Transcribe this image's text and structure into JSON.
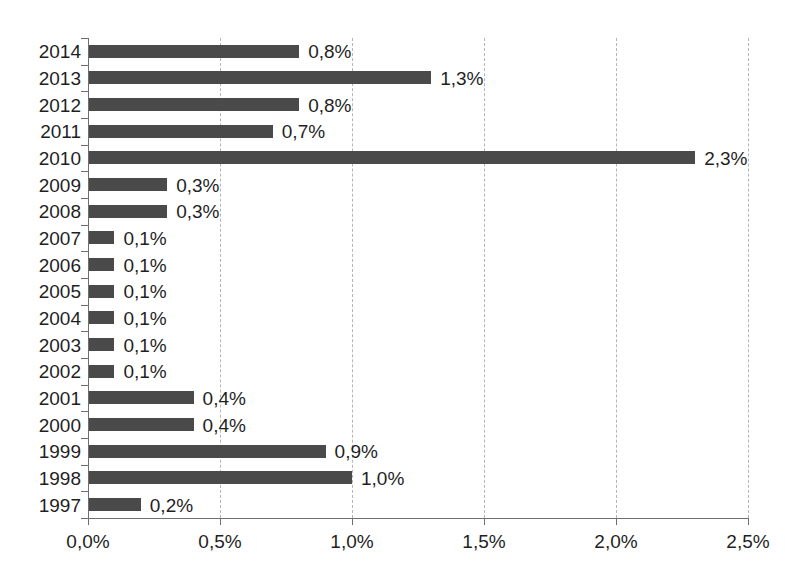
{
  "chart_data": {
    "type": "bar",
    "orientation": "horizontal",
    "title": "",
    "subtitle": "",
    "xlabel": "",
    "ylabel": "",
    "xlim": [
      0,
      2.5
    ],
    "xticks": [
      0,
      0.5,
      1.0,
      1.5,
      2.0,
      2.5
    ],
    "xtick_labels": [
      "0,0%",
      "0,5%",
      "1,0%",
      "1,5%",
      "2,0%",
      "2,5%"
    ],
    "grid": true,
    "grid_axis": "x",
    "legend": false,
    "decimal_separator": ",",
    "unit": "%",
    "bar_color": "#4a4a4a",
    "gridline_color": "#b5b5b5",
    "axis_color": "#6f6f6f",
    "categories": [
      "2014",
      "2013",
      "2012",
      "2011",
      "2010",
      "2009",
      "2008",
      "2007",
      "2006",
      "2005",
      "2004",
      "2003",
      "2002",
      "2001",
      "2000",
      "1999",
      "1998",
      "1997"
    ],
    "values": [
      0.8,
      1.3,
      0.8,
      0.7,
      2.3,
      0.3,
      0.3,
      0.1,
      0.1,
      0.1,
      0.1,
      0.1,
      0.1,
      0.4,
      0.4,
      0.9,
      1.0,
      0.2
    ],
    "data_labels": [
      "0,8%",
      "1,3%",
      "0,8%",
      "0,7%",
      "2,3%",
      "0,3%",
      "0,3%",
      "0,1%",
      "0,1%",
      "0,1%",
      "0,1%",
      "0,1%",
      "0,1%",
      "0,4%",
      "0,4%",
      "0,9%",
      "1,0%",
      "0,2%"
    ],
    "points": [
      {
        "category": "2014",
        "value": 0.8,
        "label": "0,8%"
      },
      {
        "category": "2013",
        "value": 1.3,
        "label": "1,3%"
      },
      {
        "category": "2012",
        "value": 0.8,
        "label": "0,8%"
      },
      {
        "category": "2011",
        "value": 0.7,
        "label": "0,7%"
      },
      {
        "category": "2010",
        "value": 2.3,
        "label": "2,3%"
      },
      {
        "category": "2009",
        "value": 0.3,
        "label": "0,3%"
      },
      {
        "category": "2008",
        "value": 0.3,
        "label": "0,3%"
      },
      {
        "category": "2007",
        "value": 0.1,
        "label": "0,1%"
      },
      {
        "category": "2006",
        "value": 0.1,
        "label": "0,1%"
      },
      {
        "category": "2005",
        "value": 0.1,
        "label": "0,1%"
      },
      {
        "category": "2004",
        "value": 0.1,
        "label": "0,1%"
      },
      {
        "category": "2003",
        "value": 0.1,
        "label": "0,1%"
      },
      {
        "category": "2002",
        "value": 0.1,
        "label": "0,1%"
      },
      {
        "category": "2001",
        "value": 0.4,
        "label": "0,4%"
      },
      {
        "category": "2000",
        "value": 0.4,
        "label": "0,4%"
      },
      {
        "category": "1999",
        "value": 0.9,
        "label": "0,9%"
      },
      {
        "category": "1998",
        "value": 1.0,
        "label": "1,0%"
      },
      {
        "category": "1997",
        "value": 0.2,
        "label": "0,2%"
      }
    ]
  }
}
